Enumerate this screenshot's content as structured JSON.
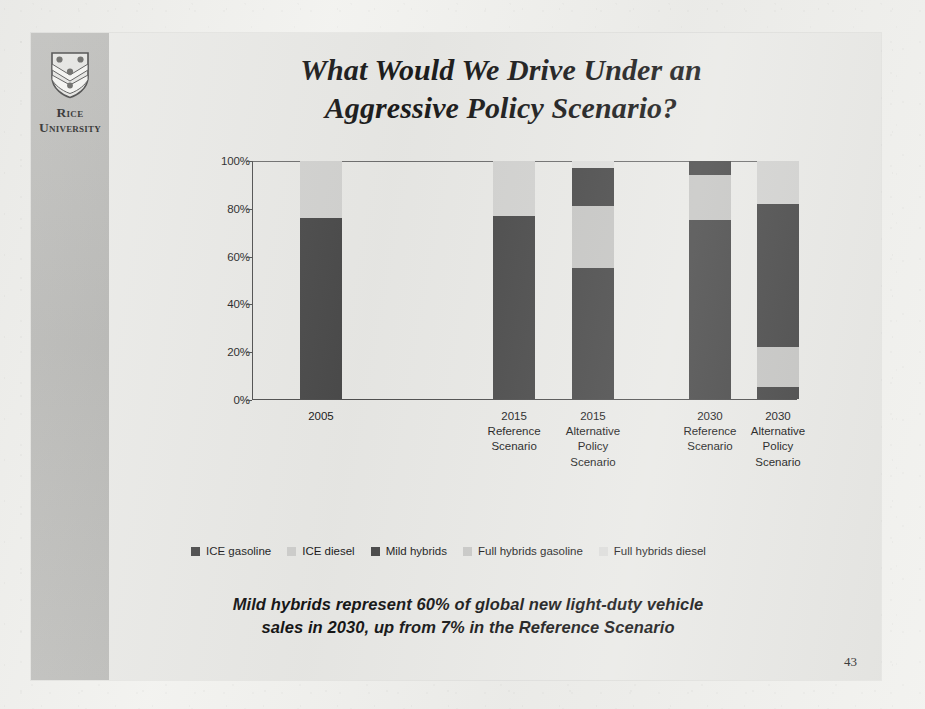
{
  "slide": {
    "title": "What Would We Drive Under an Aggressive Policy Scenario?",
    "title_line1": "What Would We Drive Under an",
    "title_line2": "Aggressive Policy Scenario?",
    "caption_line1": "Mild hybrids represent 60% of global new light-duty vehicle",
    "caption_line2": "sales in 2030, up from 7% in the Reference Scenario",
    "page_number": "43"
  },
  "branding": {
    "logo_icon": "rice-shield-icon",
    "name_line1": "Rice",
    "name_line2": "University"
  },
  "colors": {
    "ice_gasoline": "#4a4a4a",
    "ice_diesel": "#d2d2d0",
    "mild_hybrids": "#4a4a4a",
    "full_hybrids_gasoline": "#c6c6c4",
    "full_hybrids_diesel": "#dededc",
    "axis": "#4f4f4f",
    "slide_bg": "#e9e9e6",
    "rail_bg": "#b5b5b2"
  },
  "chart_data": {
    "type": "bar",
    "subtype": "stacked-100",
    "title": "",
    "xlabel": "",
    "ylabel": "",
    "ylim": [
      0,
      100
    ],
    "yticks": [
      "0%",
      "20%",
      "40%",
      "60%",
      "80%",
      "100%"
    ],
    "ytick_values": [
      0,
      20,
      40,
      60,
      80,
      100
    ],
    "grid": false,
    "legend_position": "bottom",
    "categories": [
      "2005",
      "2015 Reference Scenario",
      "2015 Alternative Policy Scenario",
      "2030 Reference Scenario",
      "2030 Alternative Policy Scenario"
    ],
    "category_labels": [
      [
        "2005"
      ],
      [
        "2015",
        "Reference",
        "Scenario"
      ],
      [
        "2015",
        "Alternative",
        "Policy",
        "Scenario"
      ],
      [
        "2030",
        "Reference",
        "Scenario"
      ],
      [
        "2030",
        "Alternative",
        "Policy",
        "Scenario"
      ]
    ],
    "series": [
      {
        "name": "ICE gasoline",
        "color": "#4a4a4a",
        "values": [
          76,
          77,
          55,
          75,
          5
        ]
      },
      {
        "name": "ICE diesel",
        "color": "#d2d2d0",
        "values": [
          24,
          23,
          0,
          0,
          0
        ]
      },
      {
        "name": "Mild hybrids",
        "color": "#4a4a4a",
        "values": [
          0,
          0,
          0,
          0,
          0
        ]
      },
      {
        "name": "Full hybrids gasoline",
        "color": "#c6c6c4",
        "values": [
          0,
          0,
          26,
          0,
          17
        ]
      },
      {
        "name": "Full hybrids diesel",
        "color": "#dededc",
        "values": [
          0,
          0,
          0,
          0,
          0
        ]
      }
    ],
    "stacks": [
      {
        "category": "2005",
        "segments": [
          {
            "series": "ICE gasoline",
            "value": 76,
            "color": "#4a4a4a"
          },
          {
            "series": "ICE diesel",
            "value": 24,
            "color": "#d2d2d0"
          }
        ]
      },
      {
        "category": "2015 Reference Scenario",
        "segments": [
          {
            "series": "ICE gasoline",
            "value": 77,
            "color": "#4a4a4a"
          },
          {
            "series": "ICE diesel",
            "value": 23,
            "color": "#d2d2d0"
          }
        ]
      },
      {
        "category": "2015 Alternative Policy Scenario",
        "segments": [
          {
            "series": "ICE gasoline",
            "value": 55,
            "color": "#4a4a4a"
          },
          {
            "series": "Full hybrids gasoline",
            "value": 26,
            "color": "#c6c6c4"
          },
          {
            "series": "Mild hybrids",
            "value": 16,
            "color": "#4a4a4a"
          },
          {
            "series": "Full hybrids diesel",
            "value": 3,
            "color": "#dededc"
          }
        ]
      },
      {
        "category": "2030 Reference Scenario",
        "segments": [
          {
            "series": "ICE gasoline",
            "value": 75,
            "color": "#4a4a4a"
          },
          {
            "series": "Full hybrids gasoline",
            "value": 19,
            "color": "#c6c6c4"
          },
          {
            "series": "Mild hybrids",
            "value": 6,
            "color": "#4a4a4a"
          }
        ]
      },
      {
        "category": "2030 Alternative Policy Scenario",
        "segments": [
          {
            "series": "ICE gasoline",
            "value": 5,
            "color": "#4a4a4a"
          },
          {
            "series": "Full hybrids gasoline",
            "value": 17,
            "color": "#c6c6c4"
          },
          {
            "series": "Mild hybrids",
            "value": 60,
            "color": "#4a4a4a"
          },
          {
            "series": "Full hybrids diesel",
            "value": 18,
            "color": "#d2d2d0"
          }
        ]
      }
    ],
    "legend": [
      {
        "label": "ICE gasoline",
        "color": "#4a4a4a"
      },
      {
        "label": "ICE diesel",
        "color": "#cfcfcd"
      },
      {
        "label": "Mild hybrids",
        "color": "#4a4a4a"
      },
      {
        "label": "Full hybrids gasoline",
        "color": "#c9c9c7"
      },
      {
        "label": "Full hybrids diesel",
        "color": "#dcdcda"
      }
    ]
  }
}
